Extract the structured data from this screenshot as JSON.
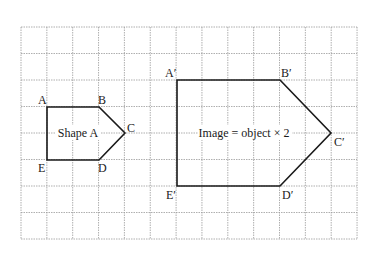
{
  "grid": {
    "x0": 21,
    "y0": 27,
    "cols": 13,
    "rows": 8,
    "cell_w": 25.85,
    "cell_h": 26.5,
    "line_color": "#9a9a9a"
  },
  "shape_a": {
    "label": "Shape A",
    "vertices": {
      "A": {
        "label": "A",
        "x": 47,
        "y": 107
      },
      "B": {
        "label": "B",
        "x": 99,
        "y": 107
      },
      "C": {
        "label": "C",
        "x": 125,
        "y": 133
      },
      "D": {
        "label": "D",
        "x": 99,
        "y": 160
      },
      "E": {
        "label": "E",
        "x": 47,
        "y": 160
      }
    }
  },
  "image_shape": {
    "label": "Image = object × 2",
    "vertices": {
      "A": {
        "label": "A′",
        "x": 177,
        "y": 80
      },
      "B": {
        "label": "B′",
        "x": 280,
        "y": 80
      },
      "C": {
        "label": "C′",
        "x": 331,
        "y": 133
      },
      "D": {
        "label": "D′",
        "x": 280,
        "y": 186
      },
      "E": {
        "label": "E′",
        "x": 177,
        "y": 186
      }
    }
  },
  "stroke_color": "#1a1a1a"
}
